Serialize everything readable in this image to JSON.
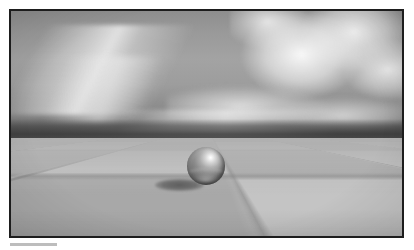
{
  "figure": {
    "name": "raytraced-sphere-on-checkerboard",
    "border_color": "#1d1d1d",
    "caption_rule_color": "#bdbdbd"
  },
  "scene": {
    "sky": {
      "name": "sky",
      "top_color": "#8e8e8e",
      "mid_color": "#a3a3a3",
      "horizon_color": "#5a5a5a",
      "haze_band_color": "#3e3e3e"
    },
    "clouds": [
      {
        "name": "cirrus-streak-upper-left",
        "type": "cirrus",
        "position": "upper-left",
        "brightness": "#f8f8f8"
      },
      {
        "name": "cirrus-streak-left",
        "type": "cirrus",
        "position": "left",
        "brightness": "#ebebeb"
      },
      {
        "name": "cumulus-bank-upper-right",
        "type": "cumulus",
        "position": "upper-right",
        "brightness": "#fcfcfc"
      },
      {
        "name": "cumulus-low-right",
        "type": "cumulus",
        "position": "right",
        "brightness": "#f4f4f4"
      },
      {
        "name": "cloud-streak-mid",
        "type": "stratus",
        "position": "center-right",
        "brightness": "#f6f6f6"
      },
      {
        "name": "cloud-streak-low",
        "type": "stratus",
        "position": "center",
        "brightness": "#eeeeee"
      }
    ],
    "ground": {
      "name": "checkerboard-plane",
      "pattern": "checkerboard",
      "light_tile_color": "#c4c4c4",
      "dark_tile_color": "#a8a8a8",
      "grid_line_color": "#6e6e6e",
      "horizon_fade": true
    },
    "sphere": {
      "name": "reflective-sphere",
      "material": "glossy-metal",
      "highlight_color": "#ffffff",
      "body_color": "#8d8d8d",
      "shadow_side_color": "#5d5d5d",
      "highlight_position": "upper-right"
    },
    "shadow": {
      "name": "cast-shadow",
      "shape": "ellipse",
      "color": "#525252",
      "direction": "lower-left"
    }
  }
}
